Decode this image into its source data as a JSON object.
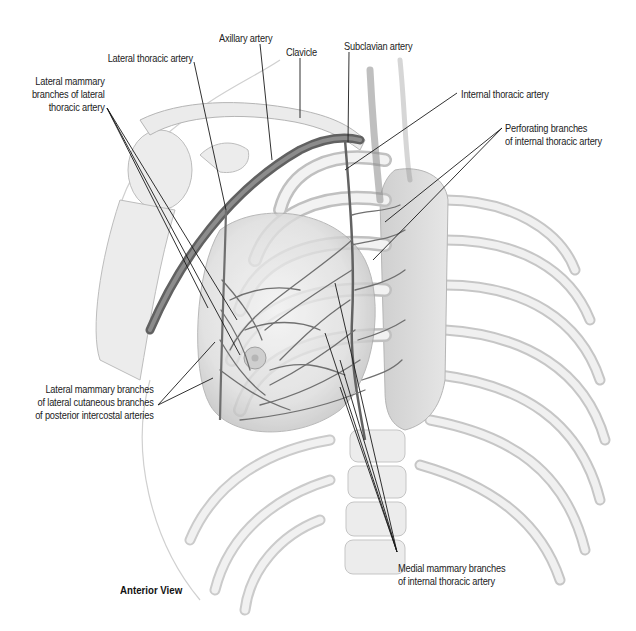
{
  "figure": {
    "view_label": "Anterior View",
    "labels": [
      {
        "id": "lateral-thoracic-artery",
        "lines": [
          "Lateral thoracic artery"
        ]
      },
      {
        "id": "axillary-artery",
        "lines": [
          "Axillary artery"
        ]
      },
      {
        "id": "clavicle",
        "lines": [
          "Clavicle"
        ]
      },
      {
        "id": "subclavian-artery",
        "lines": [
          "Subclavian artery"
        ]
      },
      {
        "id": "internal-thoracic-artery",
        "lines": [
          "Internal thoracic artery"
        ]
      },
      {
        "id": "perforating-branches",
        "lines": [
          "Perforating branches",
          "of internal thoracic artery"
        ]
      },
      {
        "id": "lateral-mammary-branches-lateral-thoracic",
        "lines": [
          "Lateral mammary",
          "branches of lateral",
          "thoracic artery"
        ]
      },
      {
        "id": "lateral-mammary-branches-intercostal",
        "lines": [
          "Lateral mammary branches",
          "of lateral cutaneous branches",
          "of posterior intercostal arteries"
        ]
      },
      {
        "id": "medial-mammary-branches",
        "lines": [
          "Medial mammary branches",
          "of internal thoracic artery"
        ]
      }
    ],
    "colors": {
      "bone": "#e9e9e9",
      "bone_outline": "#b8b8b8",
      "artery": "#6f6f6f",
      "artery_dark": "#555555",
      "leader": "#1a1a1a",
      "text": "#222222"
    }
  }
}
